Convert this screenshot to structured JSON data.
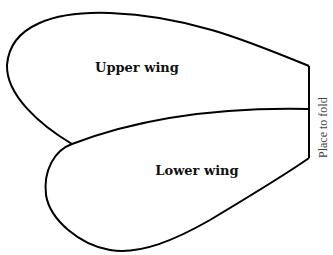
{
  "diagram": {
    "labels": {
      "upper_wing": "Upper wing",
      "lower_wing": "Lower wing",
      "fold": "Place to fold"
    },
    "colors": {
      "stroke": "#000000",
      "background": "#ffffff",
      "fold_text": "#444444"
    }
  }
}
